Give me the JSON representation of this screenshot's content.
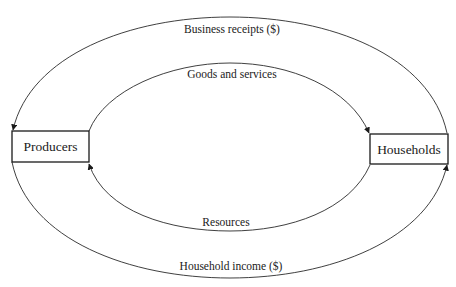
{
  "diagram": {
    "nodes": [
      {
        "id": "producers",
        "label": "Producers"
      },
      {
        "id": "households",
        "label": "Households"
      }
    ],
    "flows": [
      {
        "id": "business-receipts",
        "label": "Business receipts ($)",
        "from": "households",
        "to": "producers",
        "path": "outer-top"
      },
      {
        "id": "goods-services",
        "label": "Goods and services",
        "from": "producers",
        "to": "households",
        "path": "inner-top"
      },
      {
        "id": "resources",
        "label": "Resources",
        "from": "households",
        "to": "producers",
        "path": "inner-bottom"
      },
      {
        "id": "household-income",
        "label": "Household income ($)",
        "from": "producers",
        "to": "households",
        "path": "outer-bottom"
      }
    ]
  },
  "colors": {
    "line": "#2a2a2a",
    "text": "#1a1a1a",
    "background": "#ffffff"
  }
}
